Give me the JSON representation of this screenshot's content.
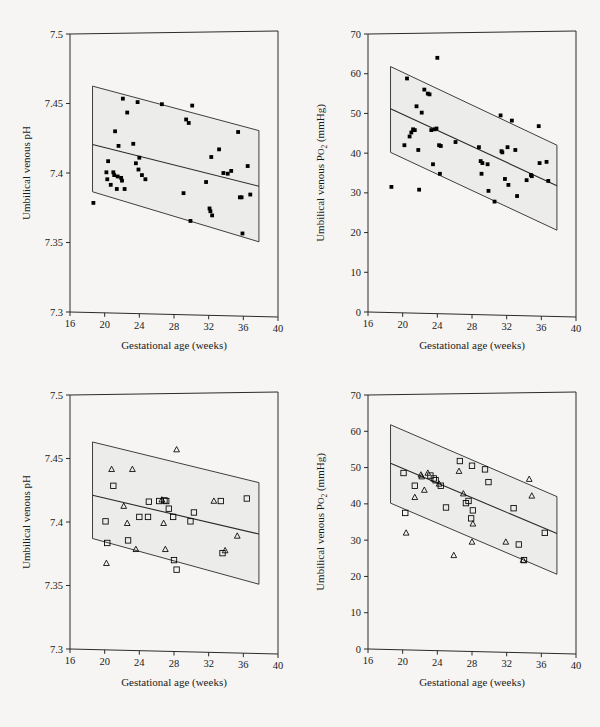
{
  "figure": {
    "name": "umbilical-venous-blood-gas-vs-gestational-age",
    "background_color": "#f6f5f3",
    "band_fill_color": "#ececea",
    "line_color": "#2a2a2a",
    "marker_color": "#000000",
    "panel_count": 4
  },
  "axes": {
    "x": {
      "label": "Gestational age  (weeks)",
      "min": 16,
      "max": 40,
      "ticks": [
        16,
        20,
        24,
        28,
        32,
        36,
        40
      ],
      "tick_labels": [
        "16",
        "20",
        "24",
        "28",
        "32",
        "36",
        "40"
      ]
    },
    "y_ph": {
      "label": "Umbilical venous pH",
      "min": 7.3,
      "max": 7.5,
      "ticks": [
        7.3,
        7.35,
        7.4,
        7.45,
        7.5
      ],
      "tick_labels": [
        "7.3",
        "7.35",
        "7.4",
        "7.45",
        "7.5"
      ]
    },
    "y_po2": {
      "label_prefix": "Umbilical venous P",
      "label_sub": "O",
      "label_sub2": "2",
      "label_suffix": " (mmHg)",
      "label_plain": "Umbilical venous Po2 (mmHg)",
      "min": 0,
      "max": 70,
      "ticks": [
        0,
        10,
        20,
        30,
        40,
        50,
        60,
        70
      ],
      "tick_labels": [
        "0",
        "10",
        "20",
        "30",
        "40",
        "50",
        "60",
        "70"
      ]
    }
  },
  "chart_data": [
    {
      "panel": "top-left",
      "type": "scatter",
      "title": "",
      "xlabel": "Gestational age  (weeks)",
      "ylabel": "Umbilical venous pH",
      "xlim": [
        16,
        40
      ],
      "ylim": [
        7.3,
        7.5
      ],
      "grid": false,
      "legend": "none",
      "marker": "filled-square",
      "regression_line": {
        "x": [
          18.6,
          37.8
        ],
        "y": [
          7.4205,
          7.3905
        ]
      },
      "prediction_band_upper": {
        "x": [
          18.6,
          37.8
        ],
        "y": [
          7.4625,
          7.4305
        ]
      },
      "prediction_band_lower": {
        "x": [
          18.6,
          37.8
        ],
        "y": [
          7.3865,
          7.3505
        ]
      },
      "points": [
        {
          "x": 18.7,
          "y": 7.3785
        },
        {
          "x": 20.2,
          "y": 7.4005
        },
        {
          "x": 20.3,
          "y": 7.3955
        },
        {
          "x": 20.4,
          "y": 7.4085
        },
        {
          "x": 20.7,
          "y": 7.3915
        },
        {
          "x": 21.0,
          "y": 7.4005
        },
        {
          "x": 21.1,
          "y": 7.3985
        },
        {
          "x": 21.2,
          "y": 7.43
        },
        {
          "x": 21.4,
          "y": 7.3885
        },
        {
          "x": 21.5,
          "y": 7.3975
        },
        {
          "x": 21.6,
          "y": 7.4195
        },
        {
          "x": 21.9,
          "y": 7.3965
        },
        {
          "x": 22.0,
          "y": 7.3945
        },
        {
          "x": 22.1,
          "y": 7.4535
        },
        {
          "x": 22.3,
          "y": 7.3885
        },
        {
          "x": 22.6,
          "y": 7.4435
        },
        {
          "x": 23.3,
          "y": 7.421
        },
        {
          "x": 23.6,
          "y": 7.407
        },
        {
          "x": 23.8,
          "y": 7.451
        },
        {
          "x": 23.9,
          "y": 7.4025
        },
        {
          "x": 24.0,
          "y": 7.411
        },
        {
          "x": 24.3,
          "y": 7.3985
        },
        {
          "x": 24.7,
          "y": 7.3955
        },
        {
          "x": 26.6,
          "y": 7.4495
        },
        {
          "x": 29.1,
          "y": 7.3855
        },
        {
          "x": 29.4,
          "y": 7.4385
        },
        {
          "x": 29.7,
          "y": 7.436
        },
        {
          "x": 29.9,
          "y": 7.3655
        },
        {
          "x": 30.1,
          "y": 7.4485
        },
        {
          "x": 31.7,
          "y": 7.3935
        },
        {
          "x": 32.1,
          "y": 7.3745
        },
        {
          "x": 32.2,
          "y": 7.3725
        },
        {
          "x": 32.3,
          "y": 7.4115
        },
        {
          "x": 32.4,
          "y": 7.3695
        },
        {
          "x": 33.2,
          "y": 7.417
        },
        {
          "x": 33.7,
          "y": 7.4
        },
        {
          "x": 34.2,
          "y": 7.3995
        },
        {
          "x": 34.6,
          "y": 7.4015
        },
        {
          "x": 35.4,
          "y": 7.4295
        },
        {
          "x": 35.6,
          "y": 7.3825
        },
        {
          "x": 35.8,
          "y": 7.3825
        },
        {
          "x": 35.9,
          "y": 7.3565
        },
        {
          "x": 36.5,
          "y": 7.405
        },
        {
          "x": 36.8,
          "y": 7.3845
        }
      ]
    },
    {
      "panel": "top-right",
      "type": "scatter",
      "title": "",
      "xlabel": "Gestational age  (weeks)",
      "ylabel": "Umbilical venous Po2 (mmHg)",
      "xlim": [
        16,
        40
      ],
      "ylim": [
        0,
        70
      ],
      "grid": false,
      "legend": "none",
      "marker": "filled-square",
      "regression_line": {
        "x": [
          18.6,
          37.8
        ],
        "y": [
          51.2,
          31.8
        ]
      },
      "prediction_band_upper": {
        "x": [
          18.6,
          37.8
        ],
        "y": [
          61.8,
          42.0
        ]
      },
      "prediction_band_lower": {
        "x": [
          18.6,
          37.8
        ],
        "y": [
          40.2,
          20.6
        ]
      },
      "points": [
        {
          "x": 18.7,
          "y": 31.5
        },
        {
          "x": 20.2,
          "y": 42.0
        },
        {
          "x": 20.5,
          "y": 58.8
        },
        {
          "x": 20.8,
          "y": 44.2
        },
        {
          "x": 21.0,
          "y": 45.2
        },
        {
          "x": 21.2,
          "y": 46.0
        },
        {
          "x": 21.4,
          "y": 45.8
        },
        {
          "x": 21.6,
          "y": 51.8
        },
        {
          "x": 21.8,
          "y": 40.8
        },
        {
          "x": 21.9,
          "y": 30.8
        },
        {
          "x": 22.2,
          "y": 50.2
        },
        {
          "x": 22.5,
          "y": 56.0
        },
        {
          "x": 22.9,
          "y": 55.0
        },
        {
          "x": 23.1,
          "y": 54.8
        },
        {
          "x": 23.3,
          "y": 45.8
        },
        {
          "x": 23.7,
          "y": 46.0
        },
        {
          "x": 23.9,
          "y": 46.2
        },
        {
          "x": 24.0,
          "y": 64.0
        },
        {
          "x": 24.2,
          "y": 42.0
        },
        {
          "x": 24.4,
          "y": 41.8
        },
        {
          "x": 24.3,
          "y": 34.8
        },
        {
          "x": 23.5,
          "y": 37.2
        },
        {
          "x": 26.1,
          "y": 42.8
        },
        {
          "x": 28.8,
          "y": 41.5
        },
        {
          "x": 29.0,
          "y": 38.0
        },
        {
          "x": 29.2,
          "y": 37.5
        },
        {
          "x": 29.1,
          "y": 34.8
        },
        {
          "x": 29.8,
          "y": 37.2
        },
        {
          "x": 29.9,
          "y": 30.5
        },
        {
          "x": 30.6,
          "y": 27.8
        },
        {
          "x": 31.3,
          "y": 49.5
        },
        {
          "x": 31.4,
          "y": 40.5
        },
        {
          "x": 31.5,
          "y": 40.2
        },
        {
          "x": 31.8,
          "y": 33.5
        },
        {
          "x": 32.1,
          "y": 41.5
        },
        {
          "x": 32.2,
          "y": 32.0
        },
        {
          "x": 32.6,
          "y": 48.2
        },
        {
          "x": 33.0,
          "y": 40.8
        },
        {
          "x": 33.2,
          "y": 29.2
        },
        {
          "x": 34.3,
          "y": 33.2
        },
        {
          "x": 34.8,
          "y": 34.5
        },
        {
          "x": 34.9,
          "y": 34.2
        },
        {
          "x": 35.7,
          "y": 46.8
        },
        {
          "x": 35.8,
          "y": 37.5
        },
        {
          "x": 36.6,
          "y": 37.8
        },
        {
          "x": 36.8,
          "y": 33.0
        }
      ]
    },
    {
      "panel": "bottom-left",
      "type": "scatter",
      "title": "",
      "xlabel": "Gestational age  (weeks)",
      "ylabel": "Umbilical venous pH",
      "xlim": [
        16,
        40
      ],
      "ylim": [
        7.3,
        7.5
      ],
      "grid": false,
      "legend": "none",
      "regression_line": {
        "x": [
          18.6,
          37.8
        ],
        "y": [
          7.421,
          7.3905
        ]
      },
      "prediction_band_upper": {
        "x": [
          18.6,
          37.8
        ],
        "y": [
          7.463,
          7.431
        ]
      },
      "prediction_band_lower": {
        "x": [
          18.6,
          37.8
        ],
        "y": [
          7.387,
          7.351
        ]
      },
      "series": [
        {
          "name": "open-square",
          "marker": "open-square",
          "points": [
            {
              "x": 20.1,
              "y": 7.4005
            },
            {
              "x": 20.3,
              "y": 7.3835
            },
            {
              "x": 21.0,
              "y": 7.4285
            },
            {
              "x": 22.7,
              "y": 7.3855
            },
            {
              "x": 24.0,
              "y": 7.404
            },
            {
              "x": 25.0,
              "y": 7.404
            },
            {
              "x": 25.1,
              "y": 7.416
            },
            {
              "x": 26.3,
              "y": 7.4165
            },
            {
              "x": 26.9,
              "y": 7.417
            },
            {
              "x": 27.1,
              "y": 7.4165
            },
            {
              "x": 27.4,
              "y": 7.4105
            },
            {
              "x": 27.9,
              "y": 7.404
            },
            {
              "x": 28.0,
              "y": 7.37
            },
            {
              "x": 28.3,
              "y": 7.3625
            },
            {
              "x": 29.9,
              "y": 7.4005
            },
            {
              "x": 30.3,
              "y": 7.4075
            },
            {
              "x": 33.4,
              "y": 7.4165
            },
            {
              "x": 33.6,
              "y": 7.3755
            },
            {
              "x": 36.4,
              "y": 7.4185
            }
          ]
        },
        {
          "name": "open-triangle",
          "marker": "open-triangle",
          "points": [
            {
              "x": 20.2,
              "y": 7.3675
            },
            {
              "x": 20.8,
              "y": 7.4415
            },
            {
              "x": 22.2,
              "y": 7.4125
            },
            {
              "x": 22.6,
              "y": 7.399
            },
            {
              "x": 23.2,
              "y": 7.4415
            },
            {
              "x": 23.6,
              "y": 7.3785
            },
            {
              "x": 26.6,
              "y": 7.4175
            },
            {
              "x": 26.8,
              "y": 7.399
            },
            {
              "x": 27.0,
              "y": 7.3785
            },
            {
              "x": 28.3,
              "y": 7.457
            },
            {
              "x": 32.6,
              "y": 7.4165
            },
            {
              "x": 33.9,
              "y": 7.3775
            },
            {
              "x": 35.3,
              "y": 7.389
            }
          ]
        }
      ]
    },
    {
      "panel": "bottom-right",
      "type": "scatter",
      "title": "",
      "xlabel": "Gestational age  (weeks)",
      "ylabel": "Umbilical venous Po2 (mmHg)",
      "xlim": [
        16,
        40
      ],
      "ylim": [
        0,
        70
      ],
      "grid": false,
      "legend": "none",
      "regression_line": {
        "x": [
          18.6,
          37.8
        ],
        "y": [
          51.2,
          31.8
        ]
      },
      "prediction_band_upper": {
        "x": [
          18.6,
          37.8
        ],
        "y": [
          61.8,
          42.0
        ]
      },
      "prediction_band_lower": {
        "x": [
          18.6,
          37.8
        ],
        "y": [
          40.2,
          20.6
        ]
      },
      "series": [
        {
          "name": "open-square",
          "marker": "open-square",
          "points": [
            {
              "x": 20.1,
              "y": 48.5
            },
            {
              "x": 20.3,
              "y": 37.5
            },
            {
              "x": 21.4,
              "y": 45.0
            },
            {
              "x": 23.2,
              "y": 47.8
            },
            {
              "x": 23.6,
              "y": 47.0
            },
            {
              "x": 23.8,
              "y": 46.5
            },
            {
              "x": 24.4,
              "y": 45.0
            },
            {
              "x": 25.0,
              "y": 39.0
            },
            {
              "x": 26.6,
              "y": 51.8
            },
            {
              "x": 27.3,
              "y": 40.2
            },
            {
              "x": 27.6,
              "y": 40.8
            },
            {
              "x": 28.0,
              "y": 50.5
            },
            {
              "x": 28.1,
              "y": 38.2
            },
            {
              "x": 27.9,
              "y": 36.0
            },
            {
              "x": 29.5,
              "y": 49.5
            },
            {
              "x": 29.9,
              "y": 46.0
            },
            {
              "x": 32.8,
              "y": 38.8
            },
            {
              "x": 33.4,
              "y": 28.8
            },
            {
              "x": 34.0,
              "y": 24.5
            },
            {
              "x": 36.4,
              "y": 32.0
            }
          ]
        },
        {
          "name": "open-triangle",
          "marker": "open-triangle",
          "points": [
            {
              "x": 20.4,
              "y": 32.0
            },
            {
              "x": 21.4,
              "y": 41.8
            },
            {
              "x": 22.1,
              "y": 48.0
            },
            {
              "x": 22.2,
              "y": 47.5
            },
            {
              "x": 22.5,
              "y": 43.8
            },
            {
              "x": 22.9,
              "y": 48.5
            },
            {
              "x": 24.2,
              "y": 45.5
            },
            {
              "x": 25.9,
              "y": 25.8
            },
            {
              "x": 26.5,
              "y": 49.0
            },
            {
              "x": 27.0,
              "y": 42.8
            },
            {
              "x": 28.1,
              "y": 34.5
            },
            {
              "x": 28.0,
              "y": 29.5
            },
            {
              "x": 31.9,
              "y": 29.5
            },
            {
              "x": 33.9,
              "y": 24.5
            },
            {
              "x": 34.6,
              "y": 46.8
            },
            {
              "x": 34.9,
              "y": 42.2
            }
          ]
        }
      ]
    }
  ]
}
